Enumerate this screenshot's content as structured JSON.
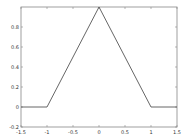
{
  "chart_data": {
    "type": "line",
    "title": "",
    "xlabel": "",
    "ylabel": "",
    "xlim": [
      -1.5,
      1.5
    ],
    "ylim": [
      -0.2,
      1.0
    ],
    "grid": false,
    "legend": null,
    "x_ticks": [
      -1.5,
      -1,
      -0.5,
      0,
      0.5,
      1,
      1.5
    ],
    "x_tick_labels": [
      "-1.5",
      "-1",
      "-0.5",
      "0",
      "0.5",
      "1",
      "1.5"
    ],
    "y_ticks": [
      -0.2,
      0,
      0.2,
      0.4,
      0.6,
      0.8
    ],
    "y_tick_labels": [
      "-0.2",
      "0",
      "0.2",
      "0.4",
      "0.6",
      "0.8"
    ],
    "series": [
      {
        "name": "triangle",
        "color": "#555555",
        "x": [
          -1.5,
          -1,
          0,
          1,
          1.5
        ],
        "y": [
          0,
          0,
          1,
          0,
          0
        ]
      }
    ]
  },
  "colors": {
    "axes": "#888888",
    "line": "#555555",
    "background": "#ffffff"
  }
}
